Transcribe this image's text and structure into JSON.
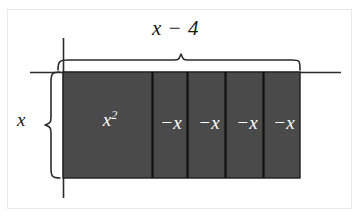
{
  "figure": {
    "type": "algebra-tile-area-diagram",
    "background_color": "#ffffff",
    "frame_border_color": "#e9e9e9",
    "tile_fill_color": "#4a4a4a",
    "tile_stroke_color": "#111111",
    "line_color": "#1a1a1a",
    "label_text_color": "#1a1a1a",
    "tile_text_color": "#ffffff"
  },
  "labels": {
    "top_dimension": "x − 4",
    "left_dimension": "x",
    "square_tile": "x",
    "square_tile_exponent": "2",
    "negative_tiles": [
      "−x",
      "−x",
      "−x",
      "−x"
    ]
  },
  "braces": {
    "top_label": "x − 4",
    "left_label": "x"
  },
  "geometry": {
    "axis_vertical_x": 63,
    "axis_horizontal_y": 72,
    "rect_left": 63,
    "rect_top": 72,
    "rect_right": 300,
    "rect_bottom": 178,
    "dividers_x": [
      152,
      187,
      225,
      263
    ]
  }
}
